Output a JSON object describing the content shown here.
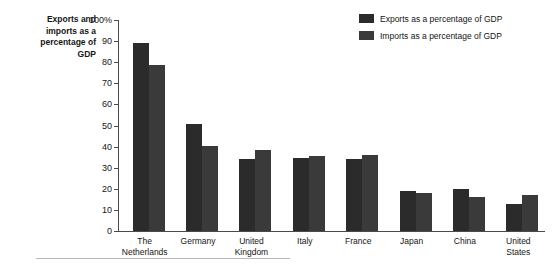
{
  "chart_data": {
    "type": "bar",
    "title_lines": [
      "Exports and",
      "imports as a",
      "percentage of",
      "GDP"
    ],
    "xlabel": "",
    "ylabel": "Exports and imports as a percentage of GDP",
    "ylim": [
      0,
      100
    ],
    "y_ticks": [
      0,
      10,
      20,
      30,
      40,
      50,
      60,
      70,
      80,
      90,
      100
    ],
    "y_tick_labels": [
      "0",
      "10",
      "20",
      "30",
      "40",
      "50",
      "60",
      "70",
      "80",
      "90",
      "100%"
    ],
    "grid": false,
    "legend_position": "top-right",
    "categories": [
      "The Netherlands",
      "Germany",
      "United Kingdom",
      "Italy",
      "France",
      "Japan",
      "China",
      "United States"
    ],
    "category_lines": [
      [
        "The",
        "Netherlands"
      ],
      [
        "Germany"
      ],
      [
        "United",
        "Kingdom"
      ],
      [
        "Italy"
      ],
      [
        "France"
      ],
      [
        "Japan"
      ],
      [
        "China"
      ],
      [
        "United",
        "States"
      ]
    ],
    "series": [
      {
        "name": "Exports as a percentage of GDP",
        "color": "#2b2b2b",
        "values": [
          89,
          50.5,
          34,
          34.5,
          34,
          19,
          20,
          13
        ]
      },
      {
        "name": "Imports as a percentage of GDP",
        "color": "#3a3a3a",
        "values": [
          78.5,
          40.5,
          38.5,
          35.5,
          36,
          18,
          16,
          17
        ]
      }
    ]
  },
  "colors": {
    "exports": "#2b2b2b",
    "imports": "#3a3a3a",
    "axis": "#4a4a4a",
    "text": "#161616",
    "rule": "#b8b8b8"
  }
}
